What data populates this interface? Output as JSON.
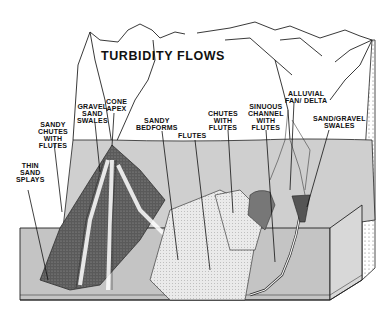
{
  "diagram": {
    "title": "TURBIDITY FLOWS",
    "labels": [
      {
        "id": "cone-apex",
        "text": "CONE\nAPEX"
      },
      {
        "id": "gravel-sand-swales",
        "text": "GRAVEL\nSAND\nSWALES"
      },
      {
        "id": "sandy-chutes-with-flutes",
        "text": "SANDY\nCHUTES\nWITH\nFLUTES"
      },
      {
        "id": "sandy-bedforms",
        "text": "SANDY\nBEDFORMS"
      },
      {
        "id": "flutes",
        "text": "FLUTES"
      },
      {
        "id": "chutes-with-flutes",
        "text": "CHUTES\nWITH\nFLUTES"
      },
      {
        "id": "sinuous-channel-with-flutes",
        "text": "SINUOUS\nCHANNEL\nWITH\nFLUTES"
      },
      {
        "id": "alluvial-fan-delta",
        "text": "ALLUVIAL\nFAN/ DELTA"
      },
      {
        "id": "sand-gravel-swales",
        "text": "SAND/GRAVEL\nSWALES"
      },
      {
        "id": "thin-sand-splays",
        "text": "THIN\nSAND\nSPLAYS"
      }
    ],
    "colors": {
      "line": "#222222",
      "water": "#c8c8c8",
      "cone": "#6e6e6e",
      "sand": "#e6e6e6",
      "background": "#ffffff"
    }
  }
}
